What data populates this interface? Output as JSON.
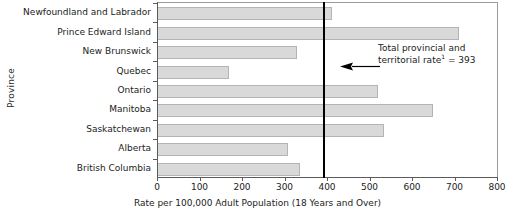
{
  "chart_data": {
    "type": "bar",
    "orientation": "horizontal",
    "title": "",
    "xlabel": "Rate per 100,000 Adult Population (18 Years and Over)",
    "ylabel": "Province",
    "categories": [
      "Newfoundland and Labrador",
      "Prince Edward Island",
      "New Brunswick",
      "Quebec",
      "Ontario",
      "Manitoba",
      "Saskatchewan",
      "Alberta",
      "British Columbia"
    ],
    "values": [
      412,
      711,
      329,
      170,
      520,
      650,
      534,
      308,
      337
    ],
    "xlim": [
      0,
      800
    ],
    "xticks": [
      0,
      100,
      200,
      300,
      400,
      500,
      600,
      700,
      800
    ],
    "xtick_labels": [
      "0",
      "100",
      "200",
      "300",
      "400",
      "500",
      "600",
      "700",
      "800"
    ],
    "grid": false,
    "legend": false,
    "bar_color": "#d9d9d9",
    "bar_edge_color": "#b4b4b4",
    "annotations": [
      {
        "name": "total-rate-reference",
        "text_line1": "Total provincial and",
        "text_line2": "territorial rate",
        "footnote_marker": "1",
        "text_line2_suffix": " = 393",
        "value": 393,
        "line_color": "#000000"
      }
    ]
  }
}
